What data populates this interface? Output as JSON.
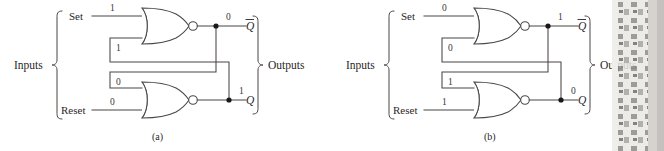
{
  "figure": {
    "panels": [
      {
        "caption": "(a)",
        "inputs_label": "Inputs",
        "outputs_label": "Outputs",
        "signals": {
          "set_label": "Set",
          "reset_label": "Reset",
          "qbar_label": "Q",
          "q_label": "Q"
        },
        "values": {
          "set": "1",
          "reset": "0",
          "feedback_upper": "1",
          "feedback_lower": "0",
          "qbar": "0",
          "q": "1"
        }
      },
      {
        "caption": "(b)",
        "inputs_label": "Inputs",
        "outputs_label": "Outputs",
        "signals": {
          "set_label": "Set",
          "reset_label": "Reset",
          "qbar_label": "Q",
          "q_label": "Q"
        },
        "values": {
          "set": "0",
          "reset": "1",
          "feedback_upper": "0",
          "feedback_lower": "1",
          "qbar": "1",
          "q": "0"
        }
      }
    ],
    "colors": {
      "wire": "#4a4644",
      "text": "#2b2726",
      "background": "#ffffff",
      "junction": "#1a1717"
    }
  }
}
